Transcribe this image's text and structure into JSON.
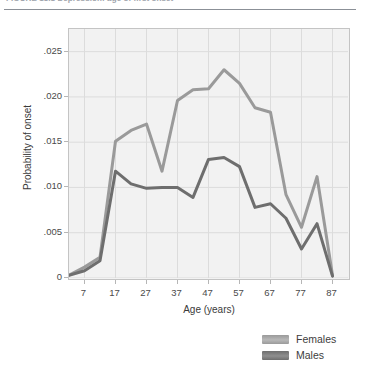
{
  "figure": {
    "caption": "FIGURE 13.1   Depression: age of first onset",
    "caption_visible_fragment": "FIGURE 13.1  Depression: age of first onset"
  },
  "colors": {
    "plot_background": "#f2f2f2",
    "plot_border": "#c4c4c4",
    "gridline": "#dcdcdc",
    "females_line": "#9a9a9a",
    "males_line": "#6e6e6e",
    "axis_text": "#4a4a4a",
    "caption_text": "#9ea3ab"
  },
  "legend": {
    "position": "bottom-right",
    "entries": [
      {
        "label": "Females",
        "color": "#9a9a9a"
      },
      {
        "label": "Males",
        "color": "#6e6e6e"
      }
    ]
  },
  "chart_data": {
    "type": "line",
    "title": "Depression: age of first onset",
    "xlabel": "Age (years)",
    "ylabel": "Probability of onset",
    "xlim": [
      2,
      92
    ],
    "ylim": [
      0,
      0.0275
    ],
    "grid": true,
    "x_ticks": [
      7,
      17,
      27,
      37,
      47,
      57,
      67,
      77,
      87
    ],
    "x_tick_labels": [
      "7",
      "17",
      "27",
      "37",
      "47",
      "57",
      "67",
      "77",
      "87"
    ],
    "y_ticks": [
      0,
      0.005,
      0.01,
      0.015,
      0.02,
      0.025
    ],
    "y_tick_labels": [
      "0",
      ".005",
      ".010",
      ".015",
      ".020",
      ".025"
    ],
    "x": [
      2,
      7,
      12,
      17,
      22,
      27,
      32,
      37,
      42,
      47,
      52,
      57,
      62,
      67,
      72,
      77,
      82,
      87
    ],
    "series": [
      {
        "name": "Females",
        "color": "#9a9a9a",
        "values": [
          0.0003,
          0.0012,
          0.0023,
          0.0151,
          0.0163,
          0.017,
          0.0118,
          0.0196,
          0.0208,
          0.0209,
          0.023,
          0.0215,
          0.0188,
          0.0183,
          0.0092,
          0.0056,
          0.0112,
          0.0003
        ]
      },
      {
        "name": "Males",
        "color": "#6e6e6e",
        "values": [
          0.0003,
          0.0008,
          0.0019,
          0.0118,
          0.0104,
          0.0099,
          0.01,
          0.01,
          0.0089,
          0.0131,
          0.0133,
          0.0123,
          0.0078,
          0.0082,
          0.0066,
          0.0032,
          0.006,
          0.0002
        ]
      }
    ]
  }
}
